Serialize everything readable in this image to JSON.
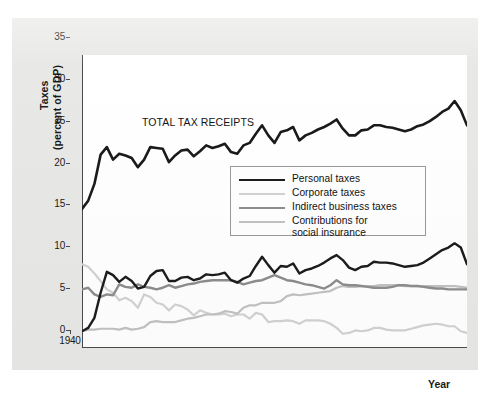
{
  "figure": {
    "background_color": "#e8e8e6",
    "plot_background_color": "#ffffff"
  },
  "annotation": {
    "total_tax_receipts": "TOTAL TAX\nRECEIPTS"
  },
  "axes": {
    "y_title_line1": "Taxes",
    "y_title_line2": "(percent of GDP)",
    "x_title": "Year",
    "y_ticks": [
      "0",
      "5",
      "10",
      "15",
      "20",
      "25",
      "30",
      "35"
    ],
    "x_ticks": [
      "1940",
      "1945",
      "1950",
      "1955",
      "1960",
      "1965",
      "1970",
      "1975",
      "1980",
      "1985",
      "1990",
      "1995",
      "2000"
    ]
  },
  "legend": {
    "items": [
      {
        "label": "Personal taxes",
        "color": "#1c1c1c",
        "width": 2.6
      },
      {
        "label": "Corporate taxes",
        "color": "#d2d2d2",
        "width": 2.2
      },
      {
        "label": "Indirect business taxes",
        "color": "#8d8d8d",
        "width": 2.4
      },
      {
        "label": "Contributions for\nsocial insurance",
        "color": "#c2c2c2",
        "width": 2.2
      }
    ]
  },
  "chart_data": {
    "type": "line",
    "title": "",
    "xlabel": "Year",
    "ylabel": "Taxes (percent of GDP)",
    "xlim": [
      1940,
      2002
    ],
    "ylim": [
      0,
      35
    ],
    "grid": false,
    "legend_position": "center-right-inside",
    "annotations": [
      {
        "text": "TOTAL TAX RECEIPTS",
        "x": 1953,
        "y": 26.5
      }
    ],
    "x": [
      1940,
      1941,
      1942,
      1943,
      1944,
      1945,
      1946,
      1947,
      1948,
      1949,
      1950,
      1951,
      1952,
      1953,
      1954,
      1955,
      1956,
      1957,
      1958,
      1959,
      1960,
      1961,
      1962,
      1963,
      1964,
      1965,
      1966,
      1967,
      1968,
      1969,
      1970,
      1971,
      1972,
      1973,
      1974,
      1975,
      1976,
      1977,
      1978,
      1979,
      1980,
      1981,
      1982,
      1983,
      1984,
      1985,
      1986,
      1987,
      1988,
      1989,
      1990,
      1991,
      1992,
      1993,
      1994,
      1995,
      1996,
      1997,
      1998,
      1999,
      2000,
      2001,
      2002
    ],
    "series": [
      {
        "name": "Total tax receipts",
        "color": "#1a1a1a",
        "width": 2.6,
        "values": [
          16.6,
          17.6,
          19.6,
          23.1,
          24.0,
          22.5,
          23.2,
          23.0,
          22.7,
          21.6,
          22.5,
          24.0,
          23.9,
          23.8,
          22.2,
          23.0,
          23.6,
          23.7,
          22.9,
          23.5,
          24.2,
          23.9,
          24.1,
          24.4,
          23.4,
          23.2,
          24.2,
          24.5,
          25.6,
          26.6,
          25.4,
          24.5,
          25.8,
          26.0,
          26.4,
          24.8,
          25.4,
          25.7,
          26.1,
          26.4,
          26.8,
          27.3,
          26.2,
          25.4,
          25.4,
          26.0,
          26.1,
          26.6,
          26.6,
          26.4,
          26.3,
          26.1,
          25.9,
          26.1,
          26.5,
          26.7,
          27.1,
          27.6,
          28.2,
          28.6,
          29.5,
          28.4,
          26.6
        ]
      },
      {
        "name": "Personal taxes",
        "color": "#1c1c1c",
        "width": 2.4,
        "values": [
          2.0,
          2.4,
          3.6,
          6.6,
          9.1,
          8.7,
          7.9,
          8.5,
          8.0,
          7.1,
          7.3,
          8.6,
          9.2,
          9.3,
          8.0,
          8.0,
          8.4,
          8.5,
          8.1,
          8.3,
          8.8,
          8.7,
          8.8,
          9.0,
          8.1,
          7.8,
          8.3,
          8.6,
          9.8,
          10.9,
          9.9,
          9.0,
          9.8,
          9.7,
          10.1,
          8.9,
          9.3,
          9.5,
          9.8,
          10.2,
          10.7,
          11.1,
          10.5,
          9.6,
          9.3,
          9.7,
          9.8,
          10.3,
          10.2,
          10.2,
          10.1,
          9.9,
          9.7,
          9.8,
          9.9,
          10.2,
          10.7,
          11.2,
          11.7,
          12.0,
          12.5,
          12.0,
          10.0
        ]
      },
      {
        "name": "Corporate taxes",
        "color": "#d2d2d2",
        "width": 2.2,
        "values": [
          10.0,
          9.7,
          8.9,
          8.0,
          7.0,
          6.6,
          5.7,
          6.0,
          5.6,
          4.8,
          6.4,
          6.1,
          5.4,
          5.2,
          4.5,
          5.2,
          5.0,
          4.6,
          3.9,
          4.5,
          4.2,
          4.0,
          4.0,
          4.1,
          3.8,
          4.0,
          4.0,
          3.5,
          4.2,
          4.0,
          3.1,
          3.2,
          3.2,
          3.3,
          3.2,
          2.9,
          3.3,
          3.3,
          3.3,
          3.2,
          2.9,
          2.4,
          1.7,
          1.8,
          2.1,
          2.0,
          2.1,
          2.4,
          2.4,
          2.2,
          2.1,
          2.1,
          2.1,
          2.3,
          2.5,
          2.7,
          2.8,
          2.9,
          2.8,
          2.6,
          2.6,
          2.0,
          1.8
        ]
      },
      {
        "name": "Indirect business taxes",
        "color": "#8d8d8d",
        "width": 2.4,
        "values": [
          7.0,
          7.2,
          6.4,
          6.1,
          6.4,
          6.3,
          7.6,
          7.3,
          7.2,
          7.6,
          7.3,
          7.2,
          7.0,
          7.2,
          7.5,
          7.2,
          7.4,
          7.6,
          7.7,
          7.9,
          8.0,
          8.1,
          8.1,
          8.1,
          8.1,
          7.9,
          7.6,
          7.8,
          8.0,
          8.1,
          8.4,
          8.7,
          8.4,
          8.1,
          8.0,
          7.8,
          7.6,
          7.5,
          7.3,
          7.1,
          7.5,
          8.1,
          7.6,
          7.5,
          7.5,
          7.4,
          7.3,
          7.2,
          7.2,
          7.2,
          7.3,
          7.5,
          7.5,
          7.4,
          7.4,
          7.3,
          7.2,
          7.1,
          7.1,
          7.0,
          7.0,
          7.0,
          7.0
        ]
      },
      {
        "name": "Contributions for social insurance",
        "color": "#c2c2c2",
        "width": 2.2,
        "values": [
          2.0,
          2.2,
          2.2,
          2.3,
          2.3,
          2.3,
          2.2,
          2.4,
          2.2,
          2.3,
          2.5,
          3.1,
          3.2,
          3.1,
          3.1,
          3.1,
          3.3,
          3.5,
          3.6,
          3.8,
          4.0,
          4.0,
          4.1,
          4.4,
          4.3,
          4.1,
          4.8,
          5.1,
          5.1,
          5.4,
          5.4,
          5.4,
          5.6,
          6.2,
          6.4,
          6.3,
          6.4,
          6.5,
          6.6,
          6.7,
          6.8,
          7.2,
          7.4,
          7.3,
          7.3,
          7.4,
          7.4,
          7.4,
          7.5,
          7.5,
          7.5,
          7.5,
          7.4,
          7.4,
          7.4,
          7.4,
          7.4,
          7.4,
          7.4,
          7.4,
          7.4,
          7.3,
          7.2
        ]
      }
    ]
  }
}
